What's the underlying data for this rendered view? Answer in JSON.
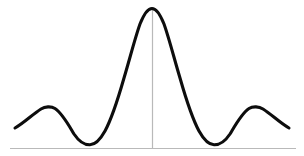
{
  "figure": {
    "title": "",
    "background_color": "#ffffff",
    "width": 304,
    "height": 156
  },
  "axes": {
    "x_axis": {
      "name": "horizontal-axis",
      "color": "#b9b9b9",
      "stroke_width": 1.2,
      "x_start": 10,
      "x_end": 296,
      "y": 148.5
    },
    "y_axis": {
      "name": "vertical-axis",
      "color": "#b9b9b9",
      "stroke_width": 1.2,
      "x": 152.5,
      "y_start": 8,
      "y_end": 148.5
    }
  },
  "curve": {
    "name": "sinc-curve",
    "color": "#0d0d0d",
    "stroke_width": 3.1,
    "path": "M 15,128 C 24,123 33,114 41,109 C 45,106.5 51,106 55,108.5 C 62,113 68,124 74,134 C 79,141.5 85,145 90,144.8 C 95,144.6 100,140 105,131 C 112,118 118,99 124,78 C 130,58 135,38 140,24 C 144,14 148,8.5 152,8.5 C 156,8.5 160,14 164,24 C 169,38 174,58 180,78 C 186,99 192,118 199,131 C 204,140 209,144.6 214,144.8 C 219,145 225,141.5 230,134 C 236,124 242,113 249,108.5 C 253,106 259,106.5 263,109 C 271,114 280,123 289,128"
  },
  "chart_data": {
    "type": "line",
    "title": "",
    "xlabel": "",
    "ylabel": "",
    "grid": false,
    "legend": null,
    "xlim": [
      -2.9,
      2.9
    ],
    "ylim": [
      -0.12,
      1.06
    ],
    "series": [
      {
        "name": "sinc",
        "x": [
          -2.9,
          -2.7,
          -2.5,
          -2.3,
          -2.1,
          -1.9,
          -1.7,
          -1.5,
          -1.3,
          -1.1,
          -1.0,
          -0.9,
          -0.7,
          -0.5,
          -0.3,
          -0.1,
          0.0,
          0.1,
          0.3,
          0.5,
          0.7,
          0.9,
          1.0,
          1.1,
          1.3,
          1.5,
          1.7,
          1.9,
          2.1,
          2.3,
          2.5,
          2.7,
          2.9
        ],
        "y": [
          0.145,
          0.195,
          0.216,
          0.19,
          0.122,
          0.039,
          0.0,
          0.021,
          0.089,
          0.17,
          0.205,
          0.234,
          0.433,
          0.637,
          0.858,
          0.984,
          1.0,
          0.984,
          0.858,
          0.637,
          0.433,
          0.234,
          0.205,
          0.17,
          0.089,
          0.021,
          0.0,
          0.039,
          0.122,
          0.19,
          0.216,
          0.195,
          0.145
        ]
      }
    ],
    "annotations": {
      "peak": {
        "x": 0.0,
        "y": 1.0
      },
      "left_zero": {
        "x": -1.7,
        "y": 0.0
      },
      "right_zero": {
        "x": 1.7,
        "y": 0.0
      },
      "left_side_lobe_peak": {
        "x": -2.5,
        "y": 0.216
      },
      "right_side_lobe_peak": {
        "x": 2.5,
        "y": 0.216
      }
    }
  }
}
